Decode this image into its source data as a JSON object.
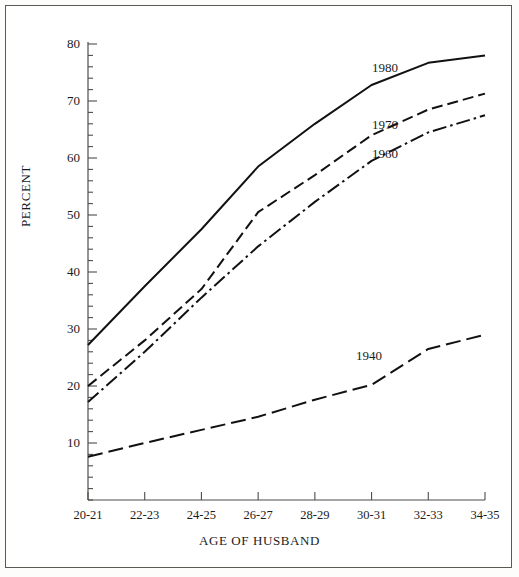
{
  "figure": {
    "y_axis_title": "PERCENT",
    "x_axis_title": "AGE OF HUSBAND"
  },
  "chart_data": {
    "type": "line",
    "title": "",
    "xlabel": "AGE OF HUSBAND",
    "ylabel": "PERCENT",
    "categories": [
      "20-21",
      "22-23",
      "24-25",
      "26-27",
      "28-29",
      "30-31",
      "32-33",
      "34-35"
    ],
    "ylim": [
      0,
      80
    ],
    "yticks": [
      10,
      20,
      30,
      40,
      50,
      60,
      70,
      80
    ],
    "ytick_labels": [
      "10",
      "20",
      "30",
      "40",
      "50",
      "60",
      "70",
      "80"
    ],
    "minor_ticks_per_interval": 4,
    "grid": false,
    "legend": "inline-labels",
    "series": [
      {
        "name": "1980",
        "linestyle": "solid",
        "color": "#111111",
        "values": [
          27.2,
          37.5,
          47.5,
          58.5,
          66.0,
          72.8,
          76.7,
          78.0
        ]
      },
      {
        "name": "1970",
        "linestyle": "dashed",
        "color": "#111111",
        "values": [
          20.0,
          28.0,
          37.0,
          50.5,
          57.0,
          64.0,
          68.5,
          71.3
        ]
      },
      {
        "name": "1960",
        "linestyle": "dashdot",
        "color": "#111111",
        "values": [
          17.2,
          26.0,
          35.5,
          44.5,
          52.3,
          59.5,
          64.5,
          67.5
        ]
      },
      {
        "name": "1940",
        "linestyle": "longdash",
        "color": "#111111",
        "values": [
          7.6,
          10.0,
          12.3,
          14.6,
          17.6,
          20.2,
          26.5,
          29.0
        ]
      }
    ]
  },
  "ticks": {
    "y": [
      {
        "label": "80",
        "value": 80
      },
      {
        "label": "70",
        "value": 70
      },
      {
        "label": "60",
        "value": 60
      },
      {
        "label": "50",
        "value": 50
      },
      {
        "label": "40",
        "value": 40
      },
      {
        "label": "30",
        "value": 30
      },
      {
        "label": "20",
        "value": 20
      },
      {
        "label": "10",
        "value": 10
      }
    ]
  },
  "series_labels": [
    {
      "text": "1980",
      "x": 372,
      "y": 60
    },
    {
      "text": "1970",
      "x": 372,
      "y": 117
    },
    {
      "text": "1960",
      "x": 372,
      "y": 146
    },
    {
      "text": "1940",
      "x": 356,
      "y": 348
    }
  ]
}
